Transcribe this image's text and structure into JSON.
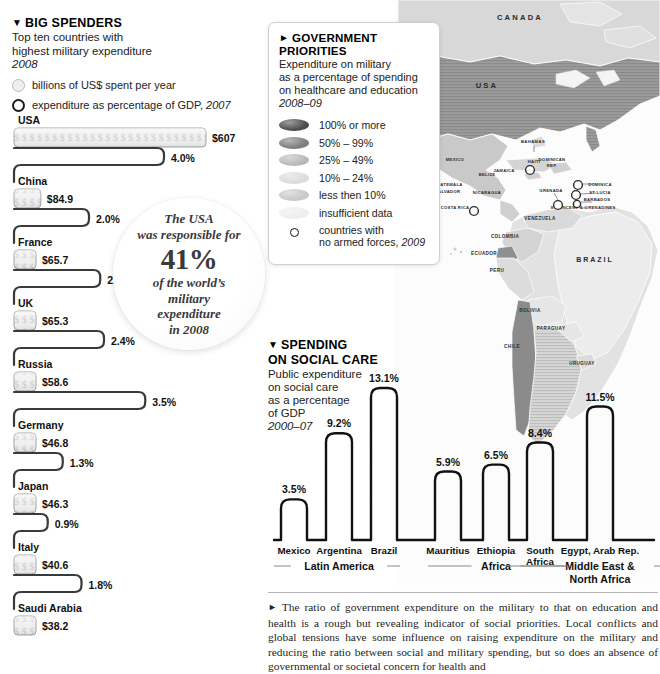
{
  "big_spenders": {
    "marker": "▼",
    "title": "BIG SPENDERS",
    "sub_line1": "Top ten countries with",
    "sub_line2": "highest military expenditure",
    "year": "2008",
    "key_billions": "billions of US$ spent per year",
    "key_pct_text": "expenditure as percentage of GDP,",
    "key_pct_year": "2007",
    "items": [
      {
        "country": "USA",
        "spend": "$607",
        "spend_value": 607.0,
        "pct": "4.0%",
        "pct_value": 4.0
      },
      {
        "country": "China",
        "spend": "$84.9",
        "spend_value": 84.9,
        "pct": "2.0%",
        "pct_value": 2.0
      },
      {
        "country": "France",
        "spend": "$65.7",
        "spend_value": 65.7,
        "pct": "2.3%",
        "pct_value": 2.3
      },
      {
        "country": "UK",
        "spend": "$65.3",
        "spend_value": 65.3,
        "pct": "2.4%",
        "pct_value": 2.4
      },
      {
        "country": "Russia",
        "spend": "$58.6",
        "spend_value": 58.6,
        "pct": "3.5%",
        "pct_value": 3.5
      },
      {
        "country": "Germany",
        "spend": "$46.8",
        "spend_value": 46.8,
        "pct": "1.3%",
        "pct_value": 1.3
      },
      {
        "country": "Japan",
        "spend": "$46.3",
        "spend_value": 46.3,
        "pct": "0.9%",
        "pct_value": 0.9
      },
      {
        "country": "Italy",
        "spend": "$40.6",
        "spend_value": 40.6,
        "pct": "1.8%",
        "pct_value": 1.8
      },
      {
        "country": "Saudi Arabia",
        "spend": "$38.2",
        "spend_value": 38.2,
        "pct": "",
        "pct_value": null
      }
    ]
  },
  "stat_circle": {
    "l1": "The USA",
    "l2": "was responsible for",
    "big": "41%",
    "l3": "of the world’s",
    "l4": "military",
    "l5": "expenditure",
    "l6": "in 2008"
  },
  "gov_priorities": {
    "marker": "►",
    "title": "GOVERNMENT PRIORITIES",
    "sub_line1": "Expenditure on military",
    "sub_line2": "as a percentage of spending",
    "sub_line3": "on healthcare and education",
    "year": "2008–09",
    "legend": [
      {
        "label": "100% or more",
        "color": "#4d4d4d"
      },
      {
        "label": "50% – 99%",
        "color": "#7d7d7d"
      },
      {
        "label": "25% – 49%",
        "color": "#b9b9b9"
      },
      {
        "label": "10% – 24%",
        "color": "#dcdcdc"
      },
      {
        "label": "less then 10%",
        "color": "#c9c9c9"
      },
      {
        "label": "insufficient data",
        "color": "#eeeeee"
      }
    ],
    "no_forces_line1": "countries with",
    "no_forces_line2": "no armed forces,",
    "no_forces_year": "2009"
  },
  "social_care": {
    "marker": "▼",
    "title_line1": "SPENDING",
    "title_line2": "ON SOCIAL CARE",
    "sub_line1": "Public expenditure",
    "sub_line2": "on social care",
    "sub_line3": "as a percentage",
    "sub_line4": "of GDP",
    "year": "2000–07"
  },
  "chart_data": [
    {
      "type": "bar",
      "title": "BIG SPENDERS — Top ten countries with highest military expenditure",
      "subtitle": "2008",
      "orientation": "horizontal",
      "categories": [
        "USA",
        "China",
        "France",
        "UK",
        "Russia",
        "Germany",
        "Japan",
        "Italy",
        "Saudi Arabia"
      ],
      "series": [
        {
          "name": "billions of US$ spent per year",
          "unit": "billion US$",
          "labels": [
            "$607",
            "$84.9",
            "$65.7",
            "$65.3",
            "$58.6",
            "$46.8",
            "$46.3",
            "$40.6",
            "$38.2"
          ],
          "values": [
            607.0,
            84.9,
            65.7,
            65.3,
            58.6,
            46.8,
            46.3,
            40.6,
            38.2
          ]
        },
        {
          "name": "expenditure as percentage of GDP, 2007",
          "unit": "% of GDP",
          "labels": [
            "4.0%",
            "2.0%",
            "2.3%",
            "2.4%",
            "3.5%",
            "1.3%",
            "0.9%",
            "1.8%",
            ""
          ],
          "values": [
            4.0,
            2.0,
            2.3,
            2.4,
            3.5,
            1.3,
            0.9,
            1.8,
            null
          ]
        }
      ],
      "annotation": "The USA was responsible for 41% of the world’s military expenditure in 2008",
      "xlabel": "",
      "ylabel": "",
      "grid": false,
      "legend": "top-left"
    },
    {
      "type": "bar",
      "title": "SPENDING ON SOCIAL CARE",
      "subtitle": "Public expenditure on social care as a percentage of GDP, 2000–07",
      "orientation": "vertical",
      "categories": [
        "Mexico",
        "Argentina",
        "Brazil",
        "Mauritius",
        "Ethiopia",
        "South Africa",
        "Egypt, Arab Rep."
      ],
      "values": [
        3.5,
        9.2,
        13.1,
        5.9,
        6.5,
        8.4,
        11.5
      ],
      "labels": [
        "3.5%",
        "9.2%",
        "13.1%",
        "5.9%",
        "6.5%",
        "8.4%",
        "11.5%"
      ],
      "groups": [
        {
          "name": "Latin America",
          "members": [
            "Mexico",
            "Argentina",
            "Brazil"
          ]
        },
        {
          "name": "Africa",
          "members": [
            "Mauritius",
            "Ethiopia",
            "South Africa"
          ]
        },
        {
          "name": "Middle East & North Africa",
          "members": [
            "Egypt, Arab Rep."
          ]
        }
      ],
      "ylabel": "% of GDP",
      "ylim": [
        0,
        13.1
      ],
      "grid": false,
      "legend": "none"
    }
  ],
  "map": {
    "labels": [
      {
        "text": "CANADA",
        "x": 520,
        "y": 20,
        "size": 7.6,
        "spacing": 2.2
      },
      {
        "text": "USA",
        "x": 487,
        "y": 88,
        "size": 7.6,
        "spacing": 2.2
      },
      {
        "text": "BAHAMAS",
        "x": 533,
        "y": 143,
        "size": 4.2,
        "spacing": 0.4
      },
      {
        "text": "MEXICO",
        "x": 455,
        "y": 161,
        "size": 4.2,
        "spacing": 0.3
      },
      {
        "text": "JAMAICA",
        "x": 504,
        "y": 172,
        "size": 4.2,
        "spacing": 0.3
      },
      {
        "text": "HAITI",
        "x": 534,
        "y": 163,
        "size": 4.2,
        "spacing": 0.3
      },
      {
        "text": "DOMINICAN",
        "x": 552,
        "y": 161,
        "size": 4.2,
        "spacing": 0.3
      },
      {
        "text": "REP.",
        "x": 552,
        "y": 167,
        "size": 4.2,
        "spacing": 0.3
      },
      {
        "text": "BELIZE",
        "x": 487,
        "y": 176,
        "size": 4.2,
        "spacing": 0.3
      },
      {
        "text": "GUATEMALA",
        "x": 448,
        "y": 186,
        "size": 4.2,
        "spacing": 0.3
      },
      {
        "text": "EL SALVADOR",
        "x": 444,
        "y": 193,
        "size": 4.2,
        "spacing": 0.3
      },
      {
        "text": "NICARAGUA",
        "x": 487,
        "y": 194,
        "size": 4.2,
        "spacing": 0.3
      },
      {
        "text": "COSTA RICA",
        "x": 455,
        "y": 209,
        "size": 4.2,
        "spacing": 0.3
      },
      {
        "text": "GRENADA",
        "x": 551,
        "y": 192,
        "size": 4.2,
        "spacing": 0.3
      },
      {
        "text": "DOMINICA",
        "x": 600,
        "y": 186,
        "size": 4.2,
        "spacing": 0.3
      },
      {
        "text": "ST LUCIA",
        "x": 600,
        "y": 194,
        "size": 4.2,
        "spacing": 0.3
      },
      {
        "text": "BARBADOS",
        "x": 597,
        "y": 201,
        "size": 4.2,
        "spacing": 0.3
      },
      {
        "text": "ST VINCENT & GRENADINES",
        "x": 583,
        "y": 209,
        "size": 4.2,
        "spacing": 0.3
      },
      {
        "text": "VENEZUELA",
        "x": 540,
        "y": 220,
        "size": 4.6,
        "spacing": 0.4
      },
      {
        "text": "COLOMBIA",
        "x": 505,
        "y": 238,
        "size": 4.6,
        "spacing": 0.4
      },
      {
        "text": "ECUADOR",
        "x": 484,
        "y": 255,
        "size": 4.6,
        "spacing": 0.4
      },
      {
        "text": "PERU",
        "x": 497,
        "y": 272,
        "size": 4.6,
        "spacing": 0.4
      },
      {
        "text": "BRAZIL",
        "x": 595,
        "y": 262,
        "size": 7.0,
        "spacing": 2.0
      },
      {
        "text": "BOLIVIA",
        "x": 530,
        "y": 312,
        "size": 4.6,
        "spacing": 0.4
      },
      {
        "text": "PARAGUAY",
        "x": 551,
        "y": 330,
        "size": 4.6,
        "spacing": 0.4
      },
      {
        "text": "CHILE",
        "x": 512,
        "y": 348,
        "size": 4.6,
        "spacing": 0.4
      },
      {
        "text": "URUGUAY",
        "x": 582,
        "y": 365,
        "size": 4.6,
        "spacing": 0.4
      }
    ],
    "no_forces_markers": [
      {
        "x": 530,
        "y": 170,
        "r": 4.4
      },
      {
        "x": 474,
        "y": 211,
        "r": 4.4
      },
      {
        "x": 578,
        "y": 185,
        "r": 4.4
      },
      {
        "x": 576,
        "y": 195,
        "r": 4.4
      },
      {
        "x": 577,
        "y": 204,
        "r": 3.6
      },
      {
        "x": 558,
        "y": 205,
        "r": 4.4
      }
    ]
  },
  "footnote": {
    "marker": "►",
    "text": "The ratio of government expenditure on the military to that on education and health is a rough but revealing indicator of social priorities. Local conflicts and global tensions have some influence on raising expenditure on the military and reducing the ratio between social and military spending, but so does an absence of governmental or societal concern for health and"
  }
}
